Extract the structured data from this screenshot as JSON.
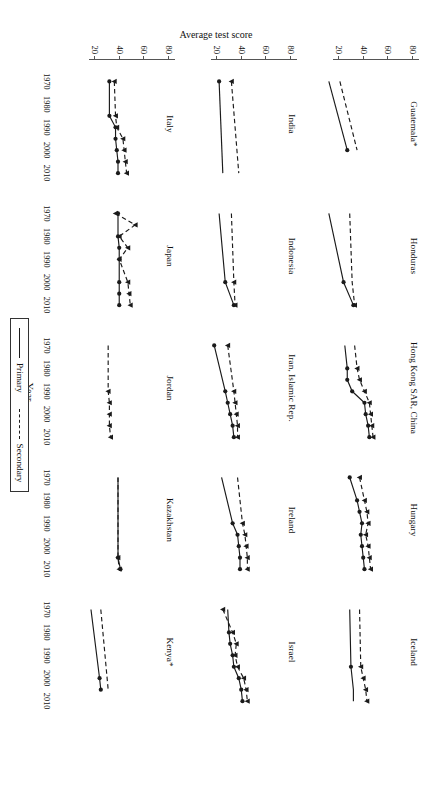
{
  "figure": {
    "y_axis_title": "Average test score",
    "x_axis_title": "Year",
    "y_ticks": [
      "80",
      "60",
      "40",
      "20"
    ],
    "x_ticks": [
      "1970",
      "1980",
      "1990",
      "2000",
      "2010"
    ]
  },
  "legend": {
    "items": [
      {
        "label": "Primary",
        "style": "solid"
      },
      {
        "label": "Secondary",
        "style": "dashed"
      }
    ]
  },
  "chart_data": {
    "type": "line",
    "xlabel": "Year",
    "ylabel": "Average test score",
    "xlim": [
      1965,
      2013
    ],
    "ylim": [
      15,
      85
    ],
    "yticks": [
      20,
      40,
      60,
      80
    ],
    "xticks": [
      1970,
      1980,
      1990,
      2000,
      2010
    ],
    "grid": false,
    "legend_position": "bottom-center",
    "legend_entries": [
      "Primary",
      "Secondary"
    ],
    "panel_layout": {
      "rows": 3,
      "cols": 5
    },
    "panels": [
      {
        "name": "Guatemala*",
        "series": [
          {
            "name": "Primary",
            "x": [
              1970,
              2000
            ],
            "y": [
              23,
              38
            ],
            "markers": [
              false,
              true
            ]
          },
          {
            "name": "Secondary",
            "x": [
              1970,
              2000
            ],
            "y": [
              32,
              46
            ],
            "markers": [
              false,
              false
            ]
          }
        ]
      },
      {
        "name": "Honduras",
        "series": [
          {
            "name": "Primary",
            "x": [
              1970,
              2000,
              2010
            ],
            "y": [
              23,
              35,
              43
            ],
            "markers": [
              false,
              true,
              true
            ]
          },
          {
            "name": "Secondary",
            "x": [
              1970,
              2000,
              2010
            ],
            "y": [
              40,
              42,
              44
            ],
            "markers": [
              false,
              false,
              true
            ]
          }
        ]
      },
      {
        "name": "Hong Kong SAR, China",
        "series": [
          {
            "name": "Primary",
            "x": [
              1970,
              1980,
              1985,
              1990,
              1995,
              2000,
              2005,
              2010
            ],
            "y": [
              36,
              38,
              38,
              42,
              52,
              53,
              55,
              56
            ],
            "markers": [
              false,
              true,
              true,
              true,
              true,
              true,
              true,
              true
            ]
          },
          {
            "name": "Secondary",
            "x": [
              1970,
              1980,
              1985,
              1990,
              1995,
              2000,
              2005,
              2010
            ],
            "y": [
              44,
              46,
              48,
              52,
              56,
              57,
              58,
              59
            ],
            "markers": [
              false,
              true,
              true,
              true,
              true,
              true,
              true,
              true
            ]
          }
        ]
      },
      {
        "name": "Hungary",
        "series": [
          {
            "name": "Primary",
            "x": [
              1970,
              1980,
              1985,
              1990,
              1995,
              2000,
              2005,
              2010
            ],
            "y": [
              40,
              46,
              48,
              50,
              49,
              50,
              51,
              52
            ],
            "markers": [
              true,
              true,
              true,
              true,
              true,
              true,
              true,
              true
            ]
          },
          {
            "name": "Secondary",
            "x": [
              1970,
              1980,
              1985,
              1990,
              1995,
              2000,
              2005,
              2010
            ],
            "y": [
              48,
              52,
              54,
              55,
              53,
              55,
              56,
              57
            ],
            "markers": [
              true,
              true,
              true,
              true,
              true,
              true,
              true,
              true
            ]
          }
        ]
      },
      {
        "name": "Iceland",
        "series": [
          {
            "name": "Primary",
            "x": [
              1970,
              1995,
              2000,
              2005,
              2010
            ],
            "y": [
              40,
              41,
              42,
              43,
              43
            ],
            "markers": [
              false,
              true,
              false,
              false,
              false
            ]
          },
          {
            "name": "Secondary",
            "x": [
              1970,
              1995,
              2000,
              2005,
              2010
            ],
            "y": [
              48,
              49,
              51,
              53,
              54
            ],
            "markers": [
              false,
              true,
              true,
              true,
              true
            ]
          }
        ]
      },
      {
        "name": "India",
        "series": [
          {
            "name": "Primary",
            "x": [
              1970,
              2010
            ],
            "y": [
              33,
              36
            ],
            "markers": [
              true,
              false
            ]
          },
          {
            "name": "Secondary",
            "x": [
              1970,
              2010
            ],
            "y": [
              43,
              49
            ],
            "markers": [
              true,
              false
            ]
          }
        ]
      },
      {
        "name": "Indonesia",
        "series": [
          {
            "name": "Primary",
            "x": [
              1970,
              2000,
              2010
            ],
            "y": [
              33,
              38,
              45
            ],
            "markers": [
              false,
              true,
              true
            ]
          },
          {
            "name": "Secondary",
            "x": [
              1970,
              2000,
              2010
            ],
            "y": [
              43,
              45,
              46
            ],
            "markers": [
              false,
              true,
              true
            ]
          }
        ]
      },
      {
        "name": "Iran, Islamic Rep.",
        "series": [
          {
            "name": "Primary",
            "x": [
              1970,
              1990,
              1995,
              2000,
              2005,
              2010
            ],
            "y": [
              29,
              38,
              40,
              42,
              44,
              45
            ],
            "markers": [
              true,
              true,
              true,
              true,
              true,
              true
            ]
          },
          {
            "name": "Secondary",
            "x": [
              1970,
              1990,
              1995,
              2000,
              2005,
              2010
            ],
            "y": [
              40,
              45,
              46,
              47,
              48,
              48
            ],
            "markers": [
              true,
              true,
              true,
              true,
              true,
              true
            ]
          }
        ]
      },
      {
        "name": "Ireland",
        "series": [
          {
            "name": "Primary",
            "x": [
              1970,
              1990,
              1995,
              2000,
              2005,
              2010
            ],
            "y": [
              35,
              44,
              48,
              49,
              50,
              50
            ],
            "markers": [
              false,
              true,
              true,
              true,
              true,
              true
            ]
          },
          {
            "name": "Secondary",
            "x": [
              1970,
              1990,
              1995,
              2000,
              2005,
              2010
            ],
            "y": [
              48,
              52,
              54,
              55,
              56,
              56
            ],
            "markers": [
              false,
              true,
              true,
              true,
              true,
              true
            ]
          }
        ]
      },
      {
        "name": "Israel",
        "series": [
          {
            "name": "Primary",
            "x": [
              1970,
              1980,
              1985,
              1990,
              1995,
              2000,
              2005,
              2010
            ],
            "y": [
              40,
              41,
              42,
              44,
              45,
              49,
              51,
              52
            ],
            "markers": [
              false,
              true,
              true,
              true,
              true,
              true,
              true,
              true
            ]
          },
          {
            "name": "Secondary",
            "x": [
              1970,
              1980,
              1985,
              1990,
              1995,
              2000,
              2005,
              2010
            ],
            "y": [
              36,
              44,
              47,
              46,
              48,
              53,
              55,
              56
            ],
            "markers": [
              true,
              true,
              true,
              true,
              true,
              true,
              true,
              true
            ]
          }
        ]
      },
      {
        "name": "Italy",
        "series": [
          {
            "name": "Primary",
            "x": [
              1970,
              1985,
              1990,
              1995,
              2000,
              2005,
              2010
            ],
            "y": [
              43,
              43,
              48,
              48,
              49,
              50,
              50
            ],
            "markers": [
              true,
              true,
              true,
              true,
              true,
              true,
              true
            ]
          },
          {
            "name": "Secondary",
            "x": [
              1970,
              1985,
              1990,
              1995,
              2000,
              2005,
              2010
            ],
            "y": [
              47,
              48,
              49,
              54,
              55,
              56,
              57
            ],
            "markers": [
              true,
              true,
              true,
              true,
              true,
              true,
              true
            ]
          }
        ]
      },
      {
        "name": "Japan",
        "series": [
          {
            "name": "Primary",
            "x": [
              1970,
              1980,
              1985,
              1990,
              2000,
              2005,
              2010
            ],
            "y": [
              50,
              50,
              51,
              51,
              51,
              51,
              51
            ],
            "markers": [
              true,
              true,
              true,
              true,
              true,
              true,
              true
            ]
          },
          {
            "name": "Secondary",
            "x": [
              1970,
              1975,
              1980,
              1985,
              1990,
              2000,
              2005,
              2010
            ],
            "y": [
              48,
              64,
              51,
              58,
              51,
              58,
              59,
              60
            ],
            "markers": [
              true,
              true,
              true,
              true,
              true,
              true,
              true,
              true
            ]
          }
        ]
      },
      {
        "name": "Jordan",
        "series": [
          {
            "name": "Primary",
            "x": [],
            "y": [],
            "markers": []
          },
          {
            "name": "Secondary",
            "x": [
              1970,
              1990,
              1995,
              2000,
              2005,
              2010
            ],
            "y": [
              42,
              42,
              43,
              43,
              43,
              44
            ],
            "markers": [
              false,
              true,
              true,
              true,
              true,
              true
            ]
          }
        ]
      },
      {
        "name": "Kazakhstan",
        "series": [
          {
            "name": "Primary",
            "x": [
              1970,
              2005,
              2010
            ],
            "y": [
              50,
              50,
              52
            ],
            "markers": [
              false,
              true,
              true
            ]
          },
          {
            "name": "Secondary",
            "x": [
              1970,
              2005,
              2010
            ],
            "y": [
              50,
              50,
              51
            ],
            "markers": [
              false,
              true,
              true
            ]
          }
        ]
      },
      {
        "name": "Kenya*",
        "series": [
          {
            "name": "Primary",
            "x": [
              1970,
              2000,
              2005
            ],
            "y": [
              28,
              35,
              36
            ],
            "markers": [
              false,
              true,
              true
            ]
          },
          {
            "name": "Secondary",
            "x": [
              1970,
              2005
            ],
            "y": [
              36,
              42
            ],
            "markers": [
              false,
              false
            ]
          }
        ]
      }
    ]
  }
}
